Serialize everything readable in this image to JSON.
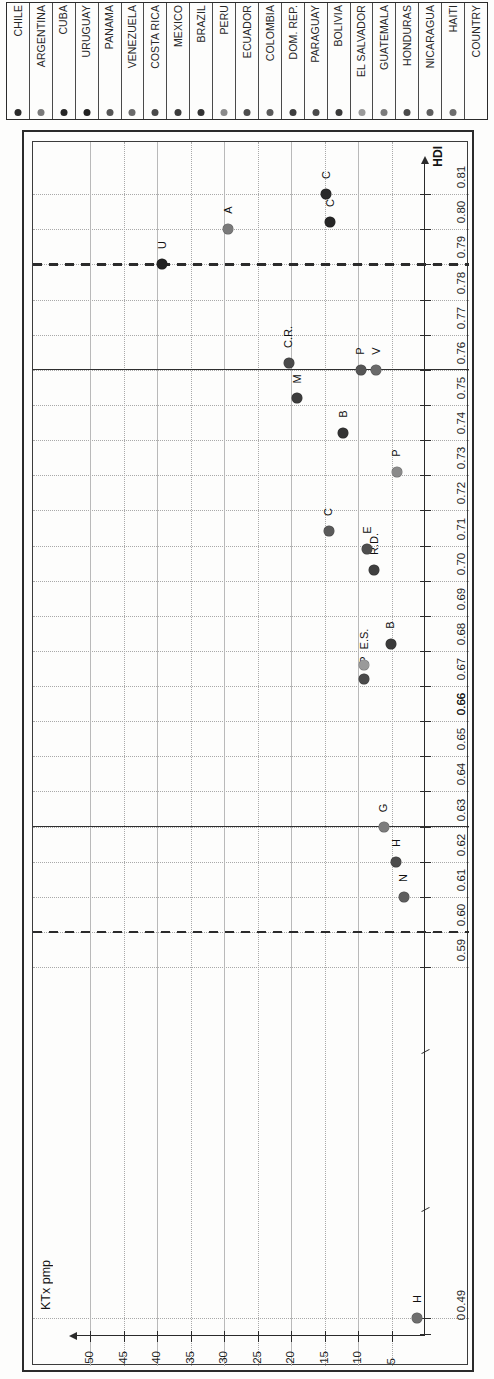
{
  "legend": {
    "header": "COUNTRY",
    "items": [
      {
        "name": "HAITI",
        "color": "#6e6e6e"
      },
      {
        "name": "NICARAGUA",
        "color": "#5e5e5e"
      },
      {
        "name": "HONDURAS",
        "color": "#4b4b4b"
      },
      {
        "name": "GUATEMALA",
        "color": "#7c7c7c"
      },
      {
        "name": "EL SALVADOR",
        "color": "#9a9a9a"
      },
      {
        "name": "BOLIVIA",
        "color": "#3a3a3a"
      },
      {
        "name": "PARAGUAY",
        "color": "#4a4a4a"
      },
      {
        "name": "DOM. REP.",
        "color": "#3f3f3f"
      },
      {
        "name": "COLOMBIA",
        "color": "#5a5a5a"
      },
      {
        "name": "ECUADOR",
        "color": "#4e4e4e"
      },
      {
        "name": "PERU",
        "color": "#8a8a8a"
      },
      {
        "name": "BRAZIL",
        "color": "#333333"
      },
      {
        "name": "MEXICO",
        "color": "#3c3c3c"
      },
      {
        "name": "COSTA RICA",
        "color": "#4a4a4a"
      },
      {
        "name": "VENEZUELA",
        "color": "#6a6a6a"
      },
      {
        "name": "PANAMA",
        "color": "#555555"
      },
      {
        "name": "URUGUAY",
        "color": "#222222"
      },
      {
        "name": "CUBA",
        "color": "#262626"
      },
      {
        "name": "ARGENTINA",
        "color": "#7a7a7a"
      },
      {
        "name": "CHILE",
        "color": "#2a2a2a"
      }
    ]
  },
  "chart_data": {
    "type": "scatter",
    "title": "",
    "xlabel": "HDI",
    "ylabel": "KTx pmp",
    "xlim": [
      0.485,
      0.818
    ],
    "ylim": [
      0,
      52
    ],
    "grid": true,
    "legend_position": "top-strip",
    "x_ticks": [
      "0",
      "0.49",
      "0.59",
      "0.60",
      "0.61",
      "0.62",
      "0.63",
      "0.64",
      "0.65",
      "0.66",
      "0.66",
      "0.67",
      "0.68",
      "0.69",
      "0.70",
      "0.71",
      "0.72",
      "0.73",
      "0.74",
      "0.75",
      "0.76",
      "0.77",
      "0.78",
      "0.79",
      "0.80",
      "0.81"
    ],
    "y_ticks": [
      "5",
      "10",
      "15",
      "20",
      "25",
      "30",
      "35",
      "40",
      "45",
      "50"
    ],
    "reference_lines": [
      {
        "value": 0.6,
        "style": "dashed",
        "axis": "x"
      },
      {
        "value": 0.63,
        "style": "solid",
        "axis": "x"
      },
      {
        "value": 0.76,
        "style": "solid",
        "axis": "x"
      },
      {
        "value": 0.79,
        "style": "dashed",
        "axis": "x"
      }
    ],
    "points": [
      {
        "label": "H",
        "country": "HAITI",
        "x": 0.49,
        "y": 1.2,
        "color": "#6e6e6e"
      },
      {
        "label": "N",
        "country": "NICARAGUA",
        "x": 0.61,
        "y": 3.2,
        "color": "#5e5e5e"
      },
      {
        "label": "H",
        "country": "HONDURAS",
        "x": 0.62,
        "y": 4.3,
        "color": "#4b4b4b"
      },
      {
        "label": "G",
        "country": "GUATEMALA",
        "x": 0.63,
        "y": 6.2,
        "color": "#7c7c7c"
      },
      {
        "label": "P",
        "country": "PARAGUAY",
        "x": 0.672,
        "y": 9.1,
        "color": "#4a4a4a"
      },
      {
        "label": "E.S.",
        "country": "EL SALVADOR",
        "x": 0.676,
        "y": 9.1,
        "color": "#9a9a9a"
      },
      {
        "label": "B",
        "country": "BOLIVIA",
        "x": 0.682,
        "y": 5.1,
        "color": "#3a3a3a"
      },
      {
        "label": "R.D.",
        "country": "DOM. REP.",
        "x": 0.703,
        "y": 7.6,
        "color": "#3f3f3f"
      },
      {
        "label": "E",
        "country": "ECUADOR",
        "x": 0.709,
        "y": 8.6,
        "color": "#4e4e4e"
      },
      {
        "label": "C",
        "country": "COLOMBIA",
        "x": 0.714,
        "y": 14.4,
        "color": "#5a5a5a"
      },
      {
        "label": "P",
        "country": "PERU",
        "x": 0.731,
        "y": 4.2,
        "color": "#8a8a8a"
      },
      {
        "label": "B",
        "country": "BRAZIL",
        "x": 0.742,
        "y": 12.2,
        "color": "#333333"
      },
      {
        "label": "M",
        "country": "MEXICO",
        "x": 0.752,
        "y": 19.1,
        "color": "#3c3c3c"
      },
      {
        "label": "C.R.",
        "country": "COSTA RICA",
        "x": 0.762,
        "y": 20.4,
        "color": "#4a4a4a"
      },
      {
        "label": "V",
        "country": "VENEZUELA",
        "x": 0.76,
        "y": 7.3,
        "color": "#6a6a6a"
      },
      {
        "label": "P",
        "country": "PANAMA",
        "x": 0.76,
        "y": 9.6,
        "color": "#555555"
      },
      {
        "label": "U",
        "country": "URUGUAY",
        "x": 0.79,
        "y": 39.3,
        "color": "#222222"
      },
      {
        "label": "A",
        "country": "ARGENTINA",
        "x": 0.8,
        "y": 29.4,
        "color": "#7a7a7a"
      },
      {
        "label": "C",
        "country": "CUBA",
        "x": 0.802,
        "y": 14.2,
        "color": "#262626"
      },
      {
        "label": "C",
        "country": "CHILE",
        "x": 0.81,
        "y": 14.8,
        "color": "#2a2a2a"
      }
    ]
  }
}
